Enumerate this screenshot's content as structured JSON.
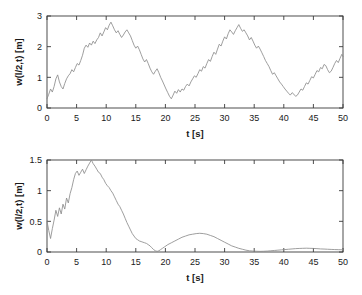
{
  "figure": {
    "background": "#ffffff",
    "line_color": "#8d8d8d",
    "axis_color": "#3a3a3a"
  },
  "chart_data": [
    {
      "type": "line",
      "id": "top-plot",
      "title": "",
      "xlabel": "t [s]",
      "ylabel": "w(l/2,t) [m]",
      "xlim": [
        0,
        50
      ],
      "ylim": [
        0,
        3
      ],
      "xticks": [
        0,
        5,
        10,
        15,
        20,
        25,
        30,
        35,
        40,
        45,
        50
      ],
      "xticklabels": [
        "0",
        "5",
        "10",
        "15",
        "20",
        "25",
        "30",
        "35",
        "40",
        "45",
        "50"
      ],
      "yticks": [
        0,
        1,
        2,
        3
      ],
      "yticklabels": [
        "0",
        "1",
        "2",
        "3"
      ],
      "grid": false,
      "legend": null,
      "series": [
        {
          "name": "w(l/2,t)",
          "color": "#8d8d8d",
          "x": [
            0.0,
            0.3,
            0.6,
            0.9,
            1.2,
            1.5,
            1.8,
            2.1,
            2.4,
            2.7,
            3.0,
            3.3,
            3.6,
            3.9,
            4.2,
            4.5,
            4.8,
            5.1,
            5.4,
            5.7,
            6.0,
            6.3,
            6.6,
            6.9,
            7.2,
            7.5,
            7.8,
            8.1,
            8.4,
            8.7,
            9.0,
            9.3,
            9.6,
            9.9,
            10.2,
            10.5,
            10.8,
            11.1,
            11.4,
            11.7,
            12.0,
            12.3,
            12.6,
            12.9,
            13.2,
            13.5,
            13.8,
            14.1,
            14.4,
            14.7,
            15.0,
            15.3,
            15.6,
            15.9,
            16.2,
            16.5,
            16.8,
            17.1,
            17.4,
            17.7,
            18.0,
            18.3,
            18.6,
            18.9,
            19.2,
            19.5,
            19.8,
            20.1,
            20.4,
            20.7,
            21.0,
            21.3,
            21.6,
            21.9,
            22.2,
            22.5,
            22.8,
            23.1,
            23.4,
            23.7,
            24.0,
            24.3,
            24.6,
            24.9,
            25.2,
            25.5,
            25.8,
            26.1,
            26.4,
            26.7,
            27.0,
            27.3,
            27.6,
            27.9,
            28.2,
            28.5,
            28.8,
            29.1,
            29.4,
            29.7,
            30.0,
            30.3,
            30.6,
            30.9,
            31.2,
            31.5,
            31.8,
            32.1,
            32.4,
            32.7,
            33.0,
            33.3,
            33.6,
            33.9,
            34.2,
            34.5,
            34.8,
            35.1,
            35.4,
            35.7,
            36.0,
            36.3,
            36.6,
            36.9,
            37.2,
            37.5,
            37.8,
            38.1,
            38.4,
            38.7,
            39.0,
            39.3,
            39.6,
            39.9,
            40.2,
            40.5,
            40.8,
            41.1,
            41.4,
            41.7,
            42.0,
            42.3,
            42.6,
            42.9,
            43.2,
            43.5,
            43.8,
            44.1,
            44.4,
            44.7,
            45.0,
            45.3,
            45.6,
            45.9,
            46.2,
            46.5,
            46.8,
            47.1,
            47.4,
            47.7,
            48.0,
            48.3,
            48.6,
            48.9,
            49.2,
            49.5,
            49.8,
            50.0
          ],
          "y": [
            0.3,
            0.45,
            0.62,
            0.52,
            0.7,
            0.95,
            1.08,
            0.85,
            0.7,
            0.62,
            0.8,
            0.95,
            1.05,
            1.12,
            1.25,
            1.18,
            1.32,
            1.45,
            1.4,
            1.55,
            1.72,
            1.95,
            2.05,
            1.98,
            2.12,
            2.05,
            2.18,
            2.1,
            2.22,
            2.3,
            2.45,
            2.35,
            2.48,
            2.62,
            2.55,
            2.7,
            2.8,
            2.68,
            2.55,
            2.45,
            2.52,
            2.4,
            2.3,
            2.38,
            2.48,
            2.55,
            2.45,
            2.35,
            2.2,
            2.05,
            1.95,
            2.02,
            1.9,
            1.75,
            1.6,
            1.5,
            1.58,
            1.45,
            1.3,
            1.18,
            1.1,
            1.2,
            1.28,
            1.15,
            1.0,
            0.88,
            0.75,
            0.62,
            0.5,
            0.38,
            0.3,
            0.42,
            0.55,
            0.48,
            0.6,
            0.52,
            0.62,
            0.58,
            0.7,
            0.78,
            0.72,
            0.85,
            0.95,
            1.05,
            1.0,
            1.12,
            1.25,
            1.2,
            1.35,
            1.3,
            1.45,
            1.58,
            1.52,
            1.68,
            1.82,
            1.75,
            1.92,
            2.08,
            2.02,
            2.18,
            2.32,
            2.25,
            2.42,
            2.55,
            2.48,
            2.4,
            2.52,
            2.62,
            2.72,
            2.6,
            2.5,
            2.55,
            2.45,
            2.35,
            2.22,
            2.3,
            2.18,
            2.05,
            1.95,
            2.02,
            1.92,
            1.8,
            1.68,
            1.55,
            1.45,
            1.35,
            1.22,
            1.1,
            1.15,
            1.05,
            0.95,
            0.85,
            0.78,
            0.7,
            0.62,
            0.55,
            0.48,
            0.42,
            0.5,
            0.45,
            0.38,
            0.42,
            0.52,
            0.62,
            0.58,
            0.7,
            0.82,
            0.78,
            0.9,
            1.02,
            0.98,
            1.1,
            1.22,
            1.18,
            1.32,
            1.28,
            1.42,
            1.38,
            1.25,
            1.15,
            1.2,
            1.32,
            1.45,
            1.55,
            1.48,
            1.62,
            1.75,
            1.68,
            1.82,
            1.95,
            1.9,
            2.05,
            2.18,
            2.12,
            2.25,
            2.38,
            2.32,
            2.45
          ]
        }
      ]
    },
    {
      "type": "line",
      "id": "bottom-plot",
      "title": "",
      "xlabel": "t [s]",
      "ylabel": "w(l/2,t) [m]",
      "xlim": [
        0,
        50
      ],
      "ylim": [
        0,
        1.5
      ],
      "xticks": [
        0,
        5,
        10,
        15,
        20,
        25,
        30,
        35,
        40,
        45,
        50
      ],
      "xticklabels": [
        "0",
        "5",
        "10",
        "15",
        "20",
        "25",
        "30",
        "35",
        "40",
        "45",
        "50"
      ],
      "yticks": [
        0,
        0.5,
        1,
        1.5
      ],
      "yticklabels": [
        "0",
        "0.5",
        "1",
        "1.5"
      ],
      "grid": false,
      "legend": null,
      "series": [
        {
          "name": "w(l/2,t)",
          "color": "#8d8d8d",
          "x": [
            0.0,
            0.3,
            0.6,
            0.9,
            1.2,
            1.5,
            1.8,
            2.1,
            2.4,
            2.7,
            3.0,
            3.3,
            3.6,
            3.9,
            4.2,
            4.5,
            4.8,
            5.1,
            5.4,
            5.7,
            6.0,
            6.3,
            6.6,
            6.9,
            7.2,
            7.5,
            7.8,
            8.1,
            8.4,
            8.7,
            9.0,
            9.3,
            9.6,
            9.9,
            10.2,
            10.5,
            10.8,
            11.1,
            11.4,
            11.7,
            12.0,
            12.3,
            12.6,
            12.9,
            13.2,
            13.5,
            13.8,
            14.1,
            14.4,
            14.7,
            15.0,
            15.3,
            15.6,
            15.9,
            16.2,
            16.5,
            16.8,
            17.1,
            17.4,
            17.7,
            18.0,
            18.3,
            18.6,
            18.9,
            19.2,
            19.5,
            19.8,
            20.1,
            20.4,
            21.0,
            21.6,
            22.2,
            22.8,
            23.4,
            24.0,
            24.6,
            25.2,
            25.8,
            26.4,
            27.0,
            27.6,
            28.2,
            28.8,
            29.4,
            30.0,
            30.6,
            31.2,
            31.8,
            32.4,
            33.0,
            33.6,
            34.2,
            34.8,
            35.4,
            36.0,
            36.6,
            37.2,
            37.8,
            38.4,
            39.0,
            39.6,
            40.2,
            40.8,
            41.4,
            42.0,
            42.6,
            43.2,
            43.8,
            44.4,
            45.0,
            45.6,
            46.2,
            46.8,
            47.4,
            48.0,
            48.6,
            49.2,
            50.0
          ],
          "y": [
            0.5,
            0.35,
            0.22,
            0.38,
            0.52,
            0.68,
            0.58,
            0.72,
            0.62,
            0.78,
            0.7,
            0.88,
            0.8,
            0.95,
            1.05,
            1.18,
            1.28,
            1.32,
            1.25,
            1.3,
            1.35,
            1.28,
            1.34,
            1.4,
            1.45,
            1.5,
            1.44,
            1.4,
            1.35,
            1.3,
            1.28,
            1.22,
            1.18,
            1.12,
            1.08,
            1.05,
            1.0,
            0.96,
            0.9,
            0.84,
            0.78,
            0.74,
            0.68,
            0.62,
            0.55,
            0.48,
            0.42,
            0.36,
            0.3,
            0.26,
            0.22,
            0.2,
            0.18,
            0.17,
            0.16,
            0.15,
            0.14,
            0.12,
            0.1,
            0.07,
            0.04,
            0.02,
            0.01,
            0.02,
            0.04,
            0.06,
            0.08,
            0.1,
            0.12,
            0.15,
            0.18,
            0.21,
            0.24,
            0.26,
            0.28,
            0.29,
            0.3,
            0.305,
            0.3,
            0.29,
            0.27,
            0.25,
            0.22,
            0.19,
            0.16,
            0.13,
            0.1,
            0.08,
            0.06,
            0.045,
            0.03,
            0.02,
            0.015,
            0.012,
            0.01,
            0.012,
            0.015,
            0.02,
            0.025,
            0.03,
            0.035,
            0.04,
            0.045,
            0.05,
            0.055,
            0.058,
            0.06,
            0.062,
            0.06,
            0.058,
            0.055,
            0.05,
            0.048,
            0.045,
            0.042,
            0.04,
            0.038,
            0.036
          ]
        }
      ]
    }
  ]
}
